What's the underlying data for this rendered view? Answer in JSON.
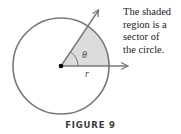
{
  "figure": {
    "label": "FIGURE 9",
    "description": "The shaded region is a sector of the circle.",
    "description_lines": [
      "The shaded",
      "region is a",
      "sector of",
      "the circle."
    ],
    "angle_symbol": "θ",
    "radius_symbol": "r"
  },
  "colors": {
    "circle_stroke": "#777777",
    "sector_fill": "#dcdcdc",
    "arrow_stroke": "#777777",
    "center_dot": "#000000"
  }
}
